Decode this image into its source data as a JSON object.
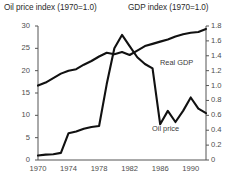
{
  "chart_data": {
    "type": "line",
    "title": "",
    "titles": {
      "left_axis_title": "Oil price index (1970=1.0)",
      "right_axis_title": "GDP index (1970=1.0)"
    },
    "xlabel": "",
    "xlim": [
      1970,
      1992
    ],
    "x_ticks": [
      1970,
      1974,
      1978,
      1982,
      1986,
      1990
    ],
    "x_tick_labels": [
      "1970",
      "1974",
      "1978",
      "1982",
      "1986",
      "1990"
    ],
    "grid": false,
    "legend": "inline-annotations",
    "axes": [
      {
        "id": "left",
        "label": "Oil price index (1970=1.0)",
        "ylim": [
          0,
          30
        ],
        "ticks": [
          0,
          5,
          10,
          15,
          20,
          25,
          30
        ],
        "tick_labels": [
          "0",
          "5",
          "10",
          "15",
          "20",
          "25",
          "30"
        ]
      },
      {
        "id": "right",
        "label": "GDP index (1970=1.0)",
        "ylim": [
          0,
          1.8
        ],
        "ticks": [
          0,
          0.2,
          0.4,
          0.6,
          0.8,
          1.0,
          1.2,
          1.4,
          1.6,
          1.8
        ],
        "tick_labels": [
          "0",
          "0.2",
          "0.4",
          "0.6",
          "0.8",
          "1.0",
          "1.2",
          "1.4",
          "1.6",
          "1.8"
        ]
      }
    ],
    "series": [
      {
        "name": "Oil price",
        "axis": "left",
        "annotation": "Oil price",
        "color": "#111111",
        "x": [
          1970,
          1971,
          1972,
          1973,
          1974,
          1975,
          1976,
          1977,
          1978,
          1979,
          1980,
          1981,
          1982,
          1983,
          1984,
          1985,
          1986,
          1987,
          1988,
          1989,
          1990,
          1991,
          1992
        ],
        "values": [
          1.0,
          1.2,
          1.3,
          1.6,
          6.0,
          6.4,
          7.0,
          7.4,
          7.6,
          17.0,
          25.0,
          28.0,
          25.5,
          23.0,
          21.5,
          20.5,
          8.0,
          11.0,
          8.5,
          11.0,
          14.0,
          11.5,
          10.5
        ]
      },
      {
        "name": "Real GDP",
        "axis": "right",
        "annotation": "Real GDP",
        "color": "#111111",
        "x": [
          1970,
          1971,
          1972,
          1973,
          1974,
          1975,
          1976,
          1977,
          1978,
          1979,
          1980,
          1981,
          1982,
          1983,
          1984,
          1985,
          1986,
          1987,
          1988,
          1989,
          1990,
          1991,
          1992
        ],
        "values": [
          1.0,
          1.04,
          1.1,
          1.16,
          1.2,
          1.22,
          1.28,
          1.33,
          1.39,
          1.44,
          1.42,
          1.45,
          1.41,
          1.47,
          1.53,
          1.56,
          1.59,
          1.62,
          1.66,
          1.69,
          1.71,
          1.72,
          1.76
        ]
      }
    ],
    "annotations": [
      {
        "text": "Real GDP",
        "x_px": 160,
        "y_px": 58
      },
      {
        "text": "Oil price",
        "x_px": 152,
        "y_px": 124
      }
    ]
  }
}
